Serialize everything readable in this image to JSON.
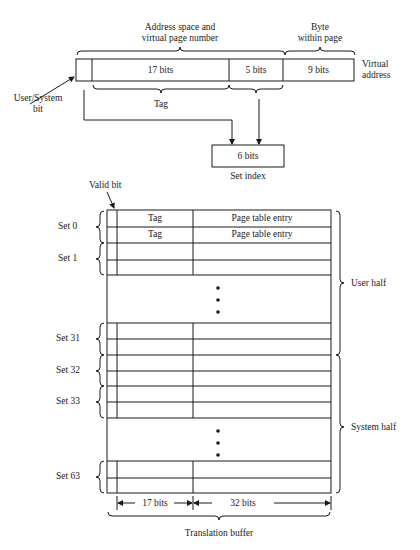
{
  "virtual_address": {
    "header_left": [
      "Address space and",
      "virtual page number"
    ],
    "header_right": [
      "Byte",
      "within page"
    ],
    "fields": [
      {
        "name": "user-system-bit",
        "label": ""
      },
      {
        "name": "vpn-17",
        "label": "17 bits"
      },
      {
        "name": "vpn-5",
        "label": "5 bits"
      },
      {
        "name": "byte-offset",
        "label": "9 bits"
      }
    ],
    "side_label": [
      "Virtual",
      "address"
    ],
    "user_system_label": [
      "User/System",
      "bit"
    ],
    "tag_label": "Tag"
  },
  "set_index": {
    "box_label": "6 bits",
    "caption": "Set index"
  },
  "translation_buffer": {
    "valid_bit_label": "Valid bit",
    "rows": [
      {
        "tag": "Tag",
        "pte": "Page table entry"
      },
      {
        "tag": "Tag",
        "pte": "Page table entry"
      }
    ],
    "set_labels": [
      "Set 0",
      "Set 1",
      "Set 31",
      "Set 32",
      "Set 33",
      "Set 63"
    ],
    "halves": [
      "User half",
      "System half"
    ],
    "tag_width_label": "17 bits",
    "pte_width_label": "32 bits",
    "caption": "Translation buffer"
  }
}
